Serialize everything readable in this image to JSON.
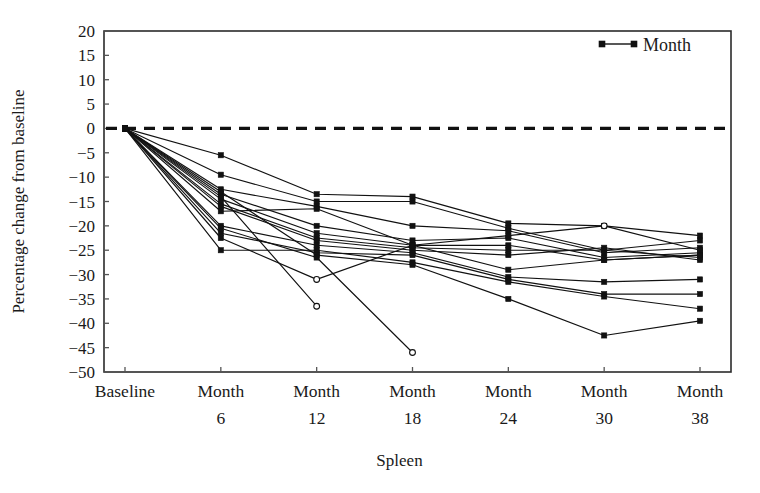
{
  "figure": {
    "kind": "line-chart",
    "background_color": "#ffffff",
    "ink_color": "#111111"
  },
  "legend": {
    "position": "top-right",
    "entries": [
      {
        "label": "Month",
        "marker": "filled-square",
        "line": "solid"
      }
    ]
  },
  "axes": {
    "y_title": "Percentage change from baseline",
    "x_title": "Spleen",
    "y_ticks": [
      "20",
      "15",
      "10",
      "5",
      "0",
      "−5",
      "−10",
      "−15",
      "−20",
      "−25",
      "−30",
      "−35",
      "−40",
      "−45",
      "−50"
    ],
    "x_categories": [
      {
        "label": "Baseline",
        "sub": ""
      },
      {
        "label": "Month",
        "sub": "6"
      },
      {
        "label": "Month",
        "sub": "12"
      },
      {
        "label": "Month",
        "sub": "18"
      },
      {
        "label": "Month",
        "sub": "24"
      },
      {
        "label": "Month",
        "sub": "30"
      },
      {
        "label": "Month",
        "sub": "38"
      }
    ],
    "reference_line_value": "0"
  },
  "chart_data": {
    "type": "line",
    "title": "",
    "subtitle": "",
    "xlabel": "Spleen",
    "ylabel": "Percentage change from baseline",
    "categories": [
      "Baseline",
      "Month 6",
      "Month 12",
      "Month 18",
      "Month 24",
      "Month 30",
      "Month 38"
    ],
    "x": [
      0,
      6,
      12,
      18,
      24,
      30,
      38
    ],
    "ylim": [
      -50,
      20
    ],
    "ytick_step": 5,
    "grid": false,
    "legend_position": "top-right",
    "reference_lines": [
      {
        "y": 0,
        "style": "dashed",
        "label": ""
      }
    ],
    "annotations": [],
    "series": [
      {
        "name": "Patient 1",
        "values": [
          0,
          -5.5,
          -13.5,
          -14.0,
          -19.5,
          -20.0,
          -22.0
        ]
      },
      {
        "name": "Patient 2",
        "values": [
          0,
          -9.5,
          -15.0,
          -15.0,
          -20.5,
          -25.0,
          -23.0
        ]
      },
      {
        "name": "Patient 3",
        "values": [
          0,
          -12.5,
          -16.0,
          -20.0,
          -21.0,
          -25.5,
          -24.5
        ]
      },
      {
        "name": "Patient 4",
        "values": [
          0,
          -13.5,
          -20.0,
          -23.0,
          -22.5,
          -26.5,
          -25.5
        ]
      },
      {
        "name": "Patient 5",
        "values": [
          0,
          -14.5,
          -21.5,
          -24.0,
          -24.0,
          -27.0,
          -26.0
        ]
      },
      {
        "name": "Patient 6",
        "values": [
          0,
          -15.5,
          -22.5,
          -24.5,
          -25.0,
          -25.0,
          -26.5
        ]
      },
      {
        "name": "Patient 7",
        "values": [
          0,
          -16.0,
          -23.0,
          -25.0,
          -26.0,
          -24.5,
          -27.0
        ]
      },
      {
        "name": "Patient 8",
        "values": [
          0,
          -17.0,
          -16.5,
          -24.0,
          -29.0,
          -27.0,
          -26.0
        ]
      },
      {
        "name": "Patient 9",
        "values": [
          0,
          -20.0,
          -24.0,
          -25.5,
          -30.5,
          -31.5,
          -31.0
        ]
      },
      {
        "name": "Patient 10",
        "values": [
          0,
          -21.5,
          -25.5,
          -26.0,
          -31.0,
          -34.0,
          -34.0
        ]
      },
      {
        "name": "Patient 11",
        "values": [
          0,
          -25.0,
          -25.0,
          -27.5,
          -31.5,
          -34.5,
          -37.0
        ]
      },
      {
        "name": "Patient 12",
        "values": [
          0,
          -13.0,
          -26.0,
          -28.0,
          -35.0,
          -42.5,
          -39.5
        ]
      },
      {
        "name": "Patient 13",
        "values": [
          0,
          -22.5,
          -31.0,
          -24.0,
          -22.0,
          -20.0,
          -25.0
        ]
      },
      {
        "name": "Patient 14",
        "values": [
          0,
          -14.0,
          -36.5,
          null,
          null,
          null,
          null
        ]
      },
      {
        "name": "Patient 15",
        "values": [
          0,
          -20.5,
          -26.5,
          -46.0,
          null,
          null,
          null
        ]
      }
    ],
    "open_marker_points": [
      {
        "series": "Patient 14",
        "category": "Month 12",
        "value": -36.5
      },
      {
        "series": "Patient 15",
        "category": "Month 18",
        "value": -46.0
      },
      {
        "series": "Patient 13",
        "category": "Month 12",
        "value": -31.0
      },
      {
        "series": "Patient 13",
        "category": "Month 30",
        "value": -20.0
      }
    ]
  }
}
